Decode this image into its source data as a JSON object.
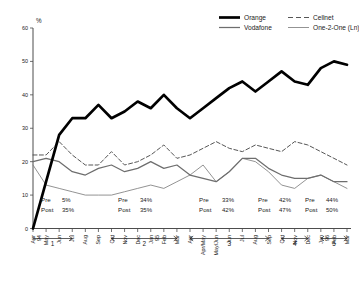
{
  "chart_data": {
    "type": "line",
    "title": "",
    "xlabel": "",
    "ylabel": "%",
    "ylim": [
      0,
      60
    ],
    "yticks": [
      0,
      10,
      20,
      30,
      40,
      50,
      60
    ],
    "grid": false,
    "legend_position": "top-right",
    "x": [
      "Apr 94",
      "May",
      "Jun",
      "Jul",
      "Aug",
      "Sep",
      "Oct",
      "Nov",
      "Dec",
      "Jan 95",
      "Feb",
      "Mar",
      "Apr",
      "Apr/May",
      "May/Jun",
      "Jun",
      "Jul",
      "Aug",
      "Sep",
      "Oct",
      "Nov",
      "Dec",
      "Jan 96",
      "Feb",
      "Mar"
    ],
    "series": [
      {
        "name": "Orange",
        "color": "#000000",
        "style": "solid-thick",
        "values": [
          0,
          14,
          28,
          33,
          33,
          37,
          33,
          35,
          38,
          36,
          40,
          36,
          33,
          36,
          39,
          42,
          44,
          41,
          44,
          47,
          44,
          43,
          48,
          50,
          49
        ]
      },
      {
        "name": "Vodafone",
        "color": "#6e6e6e",
        "style": "solid-medium",
        "values": [
          20,
          21,
          20,
          17,
          16,
          18,
          19,
          17,
          18,
          20,
          18,
          19,
          16,
          15,
          14,
          17,
          21,
          21,
          18,
          16,
          15,
          15,
          16,
          14,
          14
        ]
      },
      {
        "name": "Cellnet",
        "color": "#4d4d4d",
        "style": "dashed",
        "values": [
          22,
          22,
          26,
          22,
          19,
          19,
          23,
          19,
          20,
          22,
          25,
          21,
          22,
          24,
          26,
          24,
          23,
          25,
          24,
          23,
          26,
          25,
          23,
          21,
          19
        ]
      },
      {
        "name": "One-2-One (Ln)",
        "color": "#808080",
        "style": "solid-thin",
        "values": [
          19,
          13,
          12,
          11,
          10,
          10,
          10,
          11,
          12,
          13,
          12,
          14,
          16,
          19,
          14,
          17,
          21,
          20,
          17,
          13,
          12,
          15,
          16,
          14,
          12
        ]
      }
    ]
  },
  "legend": {
    "entries": [
      {
        "label": "Orange"
      },
      {
        "label": "Vodafone"
      },
      {
        "label": "Cellnet"
      },
      {
        "label": "One-2-One (Ln)"
      }
    ]
  },
  "periods": [
    {
      "number": "1",
      "pre_label": "Pre",
      "pre_value": "5%",
      "post_label": "Post",
      "post_value": "35%"
    },
    {
      "number": "2",
      "pre_label": "Pre",
      "pre_value": "34%",
      "post_label": "Post",
      "post_value": "35%"
    },
    {
      "number": "3",
      "pre_label": "Pre",
      "pre_value": "33%",
      "post_label": "Post",
      "post_value": "42%"
    },
    {
      "number": "4",
      "pre_label": "Pre",
      "pre_value": "42%",
      "post_label": "Post",
      "post_value": "47%"
    },
    {
      "number": "5",
      "pre_label": "Pre",
      "pre_value": "44%",
      "post_label": "Post",
      "post_value": "50%"
    }
  ]
}
